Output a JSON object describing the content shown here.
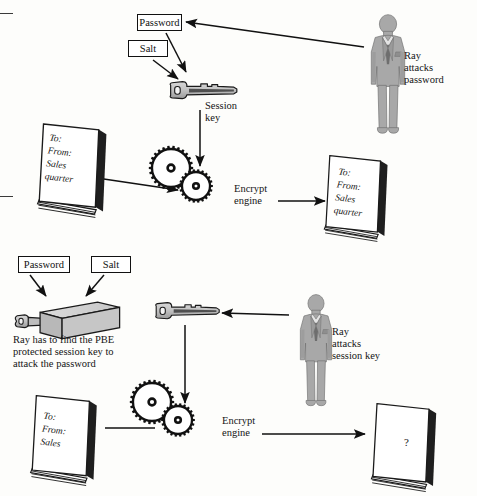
{
  "figure": {
    "background_color": "#fdfdfb",
    "ink_color": "#111111",
    "person_fill": "#a8a8a8",
    "key_fill": "#bdbdbd",
    "box_fill": "#c9c9c9"
  },
  "top_panel": {
    "password_box": "Password",
    "salt_box": "Salt",
    "session_key_label": "Session\nkey",
    "encrypt_engine_label": "Encrypt\nengine",
    "attacker_label": "Ray\nattacks\npassword",
    "plaintext_doc": "To:\nFrom:\nSales\nquarter",
    "ciphertext_doc": "To:\nFrom:\nSales\nquarter"
  },
  "bottom_panel": {
    "password_box": "Password",
    "salt_box": "Salt",
    "note": "Ray has to find the PBE\nprotected session key to\nattack the password",
    "encrypt_engine_label": "Encrypt\nengine",
    "attacker_label": "Ray\nattacks\nsession key",
    "plaintext_doc": "To:\nFrom:\nSales",
    "ciphertext_doc": "?"
  },
  "icon_names": [
    "key-icon",
    "gear-pair-icon",
    "document-stack-icon",
    "businessman-silhouette-icon",
    "pbe-box-icon",
    "arrow-icon"
  ]
}
